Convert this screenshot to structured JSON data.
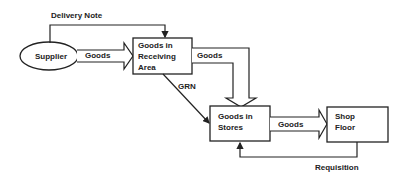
{
  "diagram": {
    "nodes": {
      "supplier": {
        "label": "Supplier",
        "shape": "ellipse"
      },
      "receiving": {
        "label": "Goods in\nReceiving\nArea",
        "shape": "rect"
      },
      "stores": {
        "label": "Goods in\nStores",
        "shape": "rect"
      },
      "shop": {
        "label": "Shop\nFloor",
        "shape": "rect"
      }
    },
    "edges": {
      "delivery_note": {
        "label": "Delivery Note",
        "from": "supplier",
        "to": "receiving"
      },
      "goods_supplier": {
        "label": "Goods",
        "from": "supplier",
        "to": "receiving"
      },
      "goods_receiving": {
        "label": "Goods",
        "from": "receiving",
        "to": "stores"
      },
      "grn": {
        "label": "GRN",
        "from": "receiving",
        "to": "stores"
      },
      "goods_stores": {
        "label": "Goods",
        "from": "stores",
        "to": "shop"
      },
      "requisition": {
        "label": "Requisition",
        "from": "shop",
        "to": "stores"
      }
    },
    "colors": {
      "stroke": "#222222",
      "background": "#ffffff"
    }
  }
}
